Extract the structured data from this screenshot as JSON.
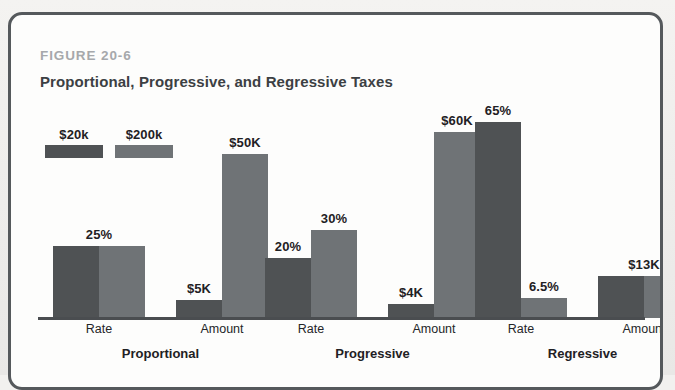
{
  "figure": {
    "number": "FIGURE 20-6",
    "title": "Proportional, Progressive, and Regressive Taxes"
  },
  "colors": {
    "series_low": "#4f5254",
    "series_high": "#6f7376",
    "axis": "#4a4d50",
    "frame": "#55595c",
    "fig_number": "#a6a8ab",
    "title": "#3c4043"
  },
  "legend": {
    "items": [
      {
        "label": "$20k",
        "color_key": "series_low"
      },
      {
        "label": "$200k",
        "color_key": "series_high"
      }
    ]
  },
  "chart_data": {
    "type": "bar",
    "title": "Proportional, Progressive, and Regressive Taxes",
    "xlabel": "",
    "ylabel": "",
    "grid": false,
    "legend_position": "top-left",
    "categories": [
      "Proportional",
      "Progressive",
      "Regressive"
    ],
    "subcategories": [
      "Rate",
      "Amount"
    ],
    "series": [
      {
        "name": "$20k",
        "color": "#4f5254"
      },
      {
        "name": "$200k",
        "color": "#6f7376"
      }
    ],
    "groups": [
      {
        "name": "Proportional",
        "pairs": [
          {
            "name": "Rate",
            "bars": [
              {
                "series": "$20k",
                "value": 25,
                "display": "25%",
                "label_shown": true,
                "height_px": 72
              },
              {
                "series": "$200k",
                "value": 25,
                "display": "25%",
                "label_shown": false,
                "height_px": 72
              }
            ]
          },
          {
            "name": "Amount",
            "bars": [
              {
                "series": "$20k",
                "value": 5,
                "display": "$5K",
                "label_shown": true,
                "height_px": 18
              },
              {
                "series": "$200k",
                "value": 50,
                "display": "$50K",
                "label_shown": true,
                "height_px": 164
              }
            ]
          }
        ]
      },
      {
        "name": "Progressive",
        "pairs": [
          {
            "name": "Rate",
            "bars": [
              {
                "series": "$20k",
                "value": 20,
                "display": "20%",
                "label_shown": true,
                "height_px": 60
              },
              {
                "series": "$200k",
                "value": 30,
                "display": "30%",
                "label_shown": true,
                "height_px": 88
              }
            ]
          },
          {
            "name": "Amount",
            "bars": [
              {
                "series": "$20k",
                "value": 4,
                "display": "$4K",
                "label_shown": true,
                "height_px": 14
              },
              {
                "series": "$200k",
                "value": 60,
                "display": "$60K",
                "label_shown": true,
                "height_px": 186
              }
            ]
          }
        ]
      },
      {
        "name": "Regressive",
        "pairs": [
          {
            "name": "Rate",
            "bars": [
              {
                "series": "$20k",
                "value": 65,
                "display": "65%",
                "label_shown": true,
                "height_px": 196
              },
              {
                "series": "$200k",
                "value": 6.5,
                "display": "6.5%",
                "label_shown": true,
                "height_px": 20
              }
            ]
          },
          {
            "name": "Amount",
            "bars": [
              {
                "series": "$20k",
                "value": 13,
                "display": "$13K",
                "label_shown": true,
                "height_px": 42
              },
              {
                "series": "$200k",
                "value": 13,
                "display": "$13K",
                "label_shown": false,
                "height_px": 42
              }
            ]
          }
        ]
      }
    ]
  },
  "layout": {
    "group_x": [
      15,
      227,
      437
    ],
    "pair_offsets": [
      0,
      123
    ],
    "bar_width": 46
  }
}
